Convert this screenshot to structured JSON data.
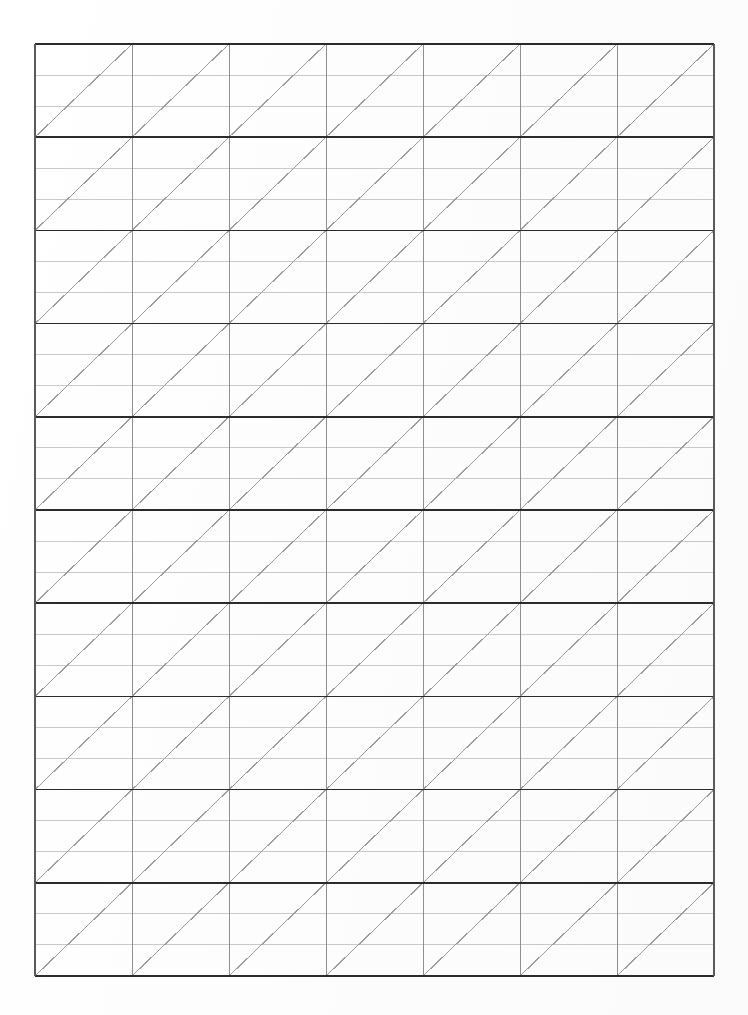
{
  "document": {
    "title": "Ruled Grid Practice Sheet",
    "kind": "scanned-ruled-paper",
    "page_width": 748,
    "page_height": 1015,
    "background_color": "#fefefe"
  },
  "grid": {
    "origin_x": 35,
    "origin_y": 44,
    "width": 679,
    "height": 932,
    "columns": 7,
    "major_rows": 10,
    "minor_rows_per_major": 3,
    "column_width": 97,
    "major_row_height": 93.2,
    "diagonal_direction": "bottom-left-to-top-right",
    "diagonals_per_cell": 1
  },
  "colors": {
    "major_horizontal_line": "#2b2b2b",
    "minor_horizontal_line": "#c9c9c9",
    "vertical_line": "#8f8f8f",
    "diagonal_line": "#9a9a9a",
    "border": "#2b2b2b",
    "paper": "#fefefe"
  },
  "chart_data": {
    "type": "table",
    "xlabel": "",
    "ylabel": "",
    "categories": [
      "col-1",
      "col-2",
      "col-3",
      "col-4",
      "col-5",
      "col-6",
      "col-7"
    ],
    "values": [
      10,
      10,
      10,
      10,
      10,
      10,
      10
    ],
    "column_x_positions": [
      0,
      97,
      194,
      291,
      388,
      485,
      582,
      679
    ],
    "major_row_y_positions": [
      0,
      93.2,
      186.4,
      279.6,
      372.8,
      466,
      559.2,
      652.4,
      745.6,
      838.8,
      932
    ],
    "grid": true,
    "legend": "none"
  }
}
